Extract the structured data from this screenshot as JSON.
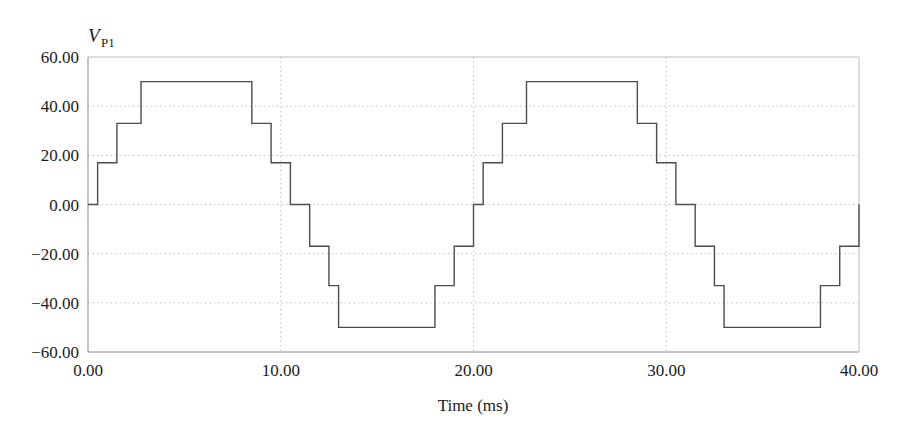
{
  "chart_data": {
    "type": "line",
    "title": "",
    "subtitle": "",
    "xlabel": "Time (ms)",
    "ylabel": "V",
    "ylabel_sub": "P1",
    "xlim": [
      0,
      40
    ],
    "ylim": [
      -60,
      60
    ],
    "grid": true,
    "legend": null,
    "xticks": [
      0,
      10,
      20,
      30,
      40
    ],
    "xtick_labels": [
      "0.00",
      "10.00",
      "20.00",
      "30.00",
      "40.00"
    ],
    "yticks": [
      -60,
      -40,
      -20,
      0,
      20,
      40,
      60
    ],
    "ytick_labels": [
      "-60.00",
      "-40.00",
      "-20.00",
      "0.00",
      "20.00",
      "40.00",
      "60.00"
    ],
    "series": [
      {
        "name": "V_P1",
        "style": "step",
        "color": "#4d4d4d",
        "x": [
          0.0,
          0.5,
          1.5,
          2.75,
          3.5,
          7.0,
          8.5,
          9.5,
          10.5,
          11.5,
          12.5,
          13.0,
          17.0,
          18.0,
          19.0,
          20.0,
          20.5,
          21.5,
          22.75,
          23.5,
          27.0,
          28.5,
          29.5,
          30.5,
          31.5,
          32.5,
          33.0,
          37.0,
          38.0,
          39.0,
          40.0
        ],
        "y": [
          0,
          17,
          33,
          50,
          50,
          50,
          33,
          17,
          0,
          -17,
          -33,
          -50,
          -50,
          -33,
          -17,
          0,
          17,
          33,
          50,
          50,
          50,
          33,
          17,
          0,
          -17,
          -33,
          -50,
          -50,
          -33,
          -17,
          0
        ]
      }
    ],
    "levels": [
      0,
      17,
      33,
      50,
      33,
      17,
      0,
      -17,
      -33,
      -50,
      -33,
      -17,
      0
    ],
    "period_ms": 20,
    "cycles": 2,
    "peak_value": 50,
    "step_levels": 7
  },
  "figure": {
    "background": "#ffffff",
    "axis_color": "#808080",
    "grid_color": "#bfbfbf",
    "line_color": "#4d4d4d",
    "text_color": "#1a1a1a"
  }
}
